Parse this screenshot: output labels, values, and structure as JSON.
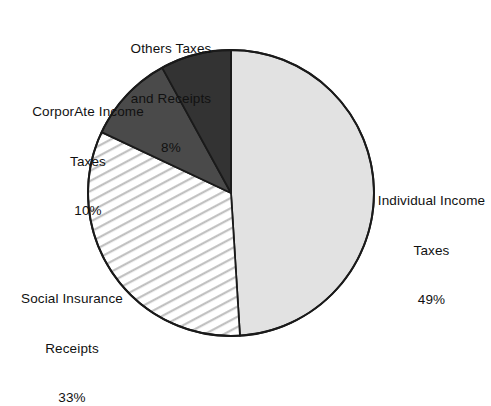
{
  "chart_data": {
    "type": "pie",
    "title": "",
    "subtitle": "",
    "xlabel": "",
    "ylabel": "",
    "grid": false,
    "legend_position": "none",
    "label_style": "external callout text, no leader lines",
    "start_angle_deg": 0,
    "direction": "clockwise",
    "units": "percent",
    "categories": [
      "Individual Income Taxes",
      "Social Insurance Receipts",
      "CorporAte Income Taxes",
      "Others Taxes and Receipts"
    ],
    "values": [
      49,
      33,
      10,
      8
    ],
    "total": 100,
    "slices": [
      {
        "id": "individual",
        "name": "Individual Income Taxes",
        "value": 49,
        "percent_label": "49%",
        "fill": "#e2e2e2",
        "pattern": "solid",
        "stroke": "#1a1a1a"
      },
      {
        "id": "social",
        "name": "Social Insurance Receipts",
        "value": 33,
        "percent_label": "33%",
        "fill": "#ffffff",
        "pattern": "diagonal-hatch",
        "stroke": "#1a1a1a"
      },
      {
        "id": "corporate",
        "name": "CorporAte Income Taxes",
        "value": 10,
        "percent_label": "10%",
        "fill": "#4a4a4a",
        "pattern": "solid",
        "stroke": "#1a1a1a"
      },
      {
        "id": "others",
        "name": "Others Taxes and Receipts",
        "value": 8,
        "percent_label": "8%",
        "fill": "#333333",
        "pattern": "solid",
        "stroke": "#1a1a1a"
      }
    ]
  },
  "labels": {
    "others": {
      "line1": "Others Taxes",
      "line2": "and Receipts",
      "percent": "8%"
    },
    "corporate": {
      "line1": "CorporAte Income",
      "line2": "Taxes",
      "percent": "10%"
    },
    "social": {
      "line1": "Social Insurance",
      "line2": "Receipts",
      "percent": "33%"
    },
    "individual": {
      "line1": "Individual Income",
      "line2": "Taxes",
      "percent": "49%"
    }
  },
  "colors": {
    "background": "#ffffff",
    "outline": "#1a1a1a",
    "text": "#111111",
    "slice_individual": "#e2e2e2",
    "slice_social_base": "#ffffff",
    "slice_social_hatch": "#bfbfbf",
    "slice_corporate": "#4a4a4a",
    "slice_others": "#333333"
  }
}
